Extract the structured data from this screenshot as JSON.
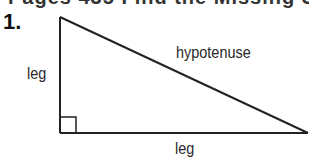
{
  "header": {
    "cut_off_text": "Pages 435 Find the Missing Side"
  },
  "problem": {
    "number": "1."
  },
  "diagram": {
    "type": "right-triangle",
    "vertices": {
      "top": [
        60,
        17
      ],
      "right_angle": [
        60,
        133
      ],
      "right": [
        308,
        133
      ]
    },
    "right_angle_marker_size": 16,
    "stroke_color": "#222222",
    "labels": {
      "vertical_leg": "leg",
      "horizontal_leg": "leg",
      "hypotenuse": "hypotenuse"
    }
  }
}
